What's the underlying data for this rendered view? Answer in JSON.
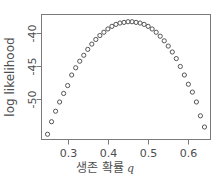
{
  "chart_data": {
    "type": "scatter",
    "title": "",
    "xlabel": "생존 확률 q",
    "xlabel_text": "생존 확률",
    "xlabel_symbol": "q",
    "ylabel": "log likelihood",
    "xlim": [
      0.235,
      0.655
    ],
    "ylim": [
      -56.2,
      -37.2
    ],
    "grid": false,
    "legend": null,
    "marker": "open-circle",
    "marker_color": "#555555",
    "frame_color": "#7a7a7a",
    "background": "#ffffff",
    "xticks": [
      0.3,
      0.4,
      0.5,
      0.6
    ],
    "xtick_labels": [
      "0.3",
      "0.4",
      "0.5",
      "0.6"
    ],
    "yticks": [
      -40,
      -45,
      -50
    ],
    "ytick_labels": [
      "-40",
      "-45",
      "-50"
    ],
    "x": [
      0.25,
      0.26,
      0.27,
      0.28,
      0.29,
      0.3,
      0.31,
      0.32,
      0.33,
      0.34,
      0.35,
      0.36,
      0.37,
      0.38,
      0.39,
      0.4,
      0.41,
      0.42,
      0.43,
      0.44,
      0.45,
      0.46,
      0.47,
      0.48,
      0.49,
      0.5,
      0.51,
      0.52,
      0.53,
      0.54,
      0.55,
      0.56,
      0.57,
      0.58,
      0.59,
      0.6,
      0.61,
      0.62,
      0.63,
      0.64
    ],
    "y": [
      -55.4,
      -53.5,
      -51.9,
      -50.5,
      -49.2,
      -48.0,
      -46.4,
      -45.3,
      -44.3,
      -43.4,
      -42.5,
      -41.7,
      -41.0,
      -40.4,
      -39.9,
      -39.4,
      -39.0,
      -38.7,
      -38.5,
      -38.4,
      -38.3,
      -38.3,
      -38.4,
      -38.5,
      -38.7,
      -39.0,
      -39.4,
      -39.9,
      -40.5,
      -41.2,
      -42.0,
      -42.9,
      -43.9,
      -45.1,
      -46.4,
      -47.8,
      -49.0,
      -50.5,
      -52.6,
      -54.3
    ],
    "series_name": "log likelihood",
    "n_points": 40,
    "peak": {
      "x": 0.455,
      "y": -38.3
    }
  }
}
